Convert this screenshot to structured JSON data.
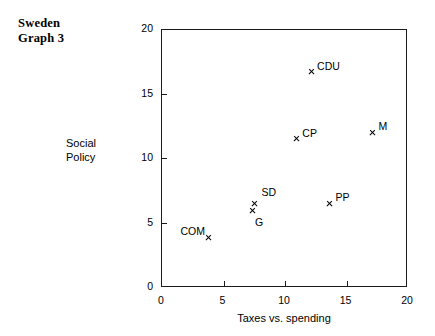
{
  "title_block": {
    "line1": "Sweden",
    "line2": "Graph 3"
  },
  "chart_data": {
    "type": "scatter",
    "title": "Sweden Graph 3",
    "xlabel": "Taxes vs. spending",
    "ylabel": "Social Policy",
    "ylabel_line1": "Social",
    "ylabel_line2": "Policy",
    "xlim": [
      0,
      20
    ],
    "ylim": [
      0,
      20
    ],
    "xticks": [
      0,
      5,
      10,
      15,
      20
    ],
    "yticks": [
      0,
      5,
      10,
      15,
      20
    ],
    "xtick_labels": [
      "0",
      "5",
      "10",
      "15",
      "20"
    ],
    "ytick_labels": [
      "0",
      "5",
      "10",
      "15",
      "20"
    ],
    "grid": false,
    "legend": "none",
    "marker": "x",
    "points": [
      {
        "label": "CDU",
        "x": 12.2,
        "y": 16.7,
        "label_pos": "right"
      },
      {
        "label": "CP",
        "x": 11.0,
        "y": 11.5,
        "label_pos": "right"
      },
      {
        "label": "M",
        "x": 17.2,
        "y": 12.0,
        "label_pos": "right"
      },
      {
        "label": "SD",
        "x": 7.6,
        "y": 6.5,
        "label_pos": "above-right"
      },
      {
        "label": "G",
        "x": 7.4,
        "y": 5.9,
        "label_pos": "below-right"
      },
      {
        "label": "PP",
        "x": 13.7,
        "y": 6.5,
        "label_pos": "right"
      },
      {
        "label": "COM",
        "x": 3.9,
        "y": 3.8,
        "label_pos": "left"
      }
    ]
  }
}
